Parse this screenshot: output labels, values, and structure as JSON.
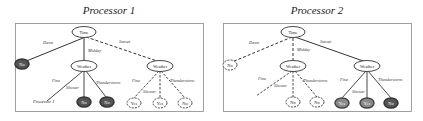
{
  "panels": [
    {
      "title": "Processor 1",
      "root": "Time",
      "edges": {
        "dawn": "Dawn",
        "midday": "Midday",
        "sunset": "Sunset"
      },
      "midday_node": "Weather",
      "sunset_node": "Weather",
      "dawn_leaf": "No",
      "midday_branches": {
        "fine": "Fine",
        "shower": "Shower",
        "thunderstorm": "Thunderstorm"
      },
      "midday_leaves": [
        "Processor 1",
        "No",
        "No"
      ],
      "sunset_branches": {
        "fine": "Fine",
        "shower": "Shower",
        "thunderstorm": "Thunderstorm"
      },
      "sunset_leaves": [
        "Yes",
        "Yes",
        "No"
      ]
    },
    {
      "title": "Processor 2",
      "root": "Time",
      "edges": {
        "dawn": "Dawn",
        "midday": "Midday",
        "sunset": "Sunset"
      },
      "midday_node": "Weather",
      "sunset_node": "Weather",
      "dawn_leaf": "No",
      "midday_branches": {
        "fine": "Fine",
        "shower": "Shower",
        "thunderstorm": "Thunderstorm"
      },
      "midday_leaves": [
        "No",
        "No"
      ],
      "sunset_branches": {
        "fine": "Fine",
        "shower": "Shower",
        "thunderstorm": "Thunderstorm"
      },
      "sunset_leaves": [
        "Yes",
        "Yes",
        "No"
      ]
    }
  ],
  "colors": {
    "line": "#333333",
    "frame": "#888888",
    "leaf_dark": "#555555",
    "leaf_mid": "#8a8a8a"
  }
}
